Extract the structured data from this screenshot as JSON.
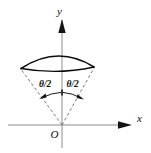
{
  "figure": {
    "background_color": "#ffffff",
    "stroke_color": "#0d0d0d",
    "axis_color": "#8c8c8c",
    "dashed_color": "#6b6b6b",
    "axes": {
      "y_axis_label": "y",
      "x_axis_label": "x",
      "origin_label": "O"
    },
    "labels": {
      "left_angle": "θ/2",
      "right_angle": "θ/2"
    },
    "geometry": {
      "origin": {
        "x": 62,
        "y": 125
      },
      "y_axis": {
        "x": 62,
        "y_top": 18,
        "y_bottom": 148
      },
      "x_axis": {
        "y": 125,
        "x_left": 8,
        "x_right": 132
      },
      "cap_left_tip": {
        "x": 21,
        "y": 68
      },
      "cap_right_tip": {
        "x": 94,
        "y": 67
      },
      "cap_apex": {
        "x": 60,
        "y": 52
      },
      "angle_arc_radius": 28,
      "half_angle_degrees": 27
    }
  }
}
